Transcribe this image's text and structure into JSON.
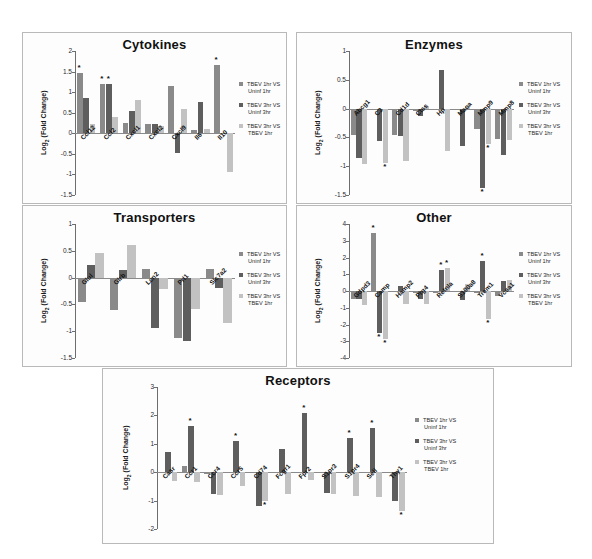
{
  "figure": {
    "series_colors": [
      "#8a8a8a",
      "#5e5e5e",
      "#c2c2c2"
    ],
    "legend": [
      {
        "label_line1": "TBEV 1hr VS",
        "label_line2": "Uninf 1hr"
      },
      {
        "label_line1": "TBEV 3hr VS",
        "label_line2": "Uninf 3hr"
      },
      {
        "label_line1": "TBEV 3hr VS",
        "label_line2": "TBEV 1hr"
      }
    ],
    "ylabel": "Log2 (Fold Change)",
    "significance_marker": "*"
  },
  "chart_data": [
    {
      "type": "bar",
      "title": "Cytokines",
      "xlabel": "",
      "ylabel": "Log2 (Fold Change)",
      "ylim": [
        -1.5,
        2
      ],
      "yticks": [
        2,
        1.5,
        1,
        0.5,
        0,
        -0.5,
        -1,
        -1.5
      ],
      "ytick_labels": [
        "2",
        "1.5",
        "1",
        "0.5",
        "0",
        "-0.5",
        "-1",
        "-1.5"
      ],
      "grid": false,
      "legend_position": "right",
      "categories": [
        "Ccl12",
        "Ccl2",
        "Cxcl1",
        "Cxcl2",
        "Cxcl9",
        "Il6",
        "Il10"
      ],
      "series": [
        {
          "name": "TBEV 1hr VS Uninf 1hr",
          "values": [
            1.47,
            1.19,
            0.24,
            0.23,
            1.15,
            0.07,
            1.66
          ]
        },
        {
          "name": "TBEV 3hr VS Uninf 3hr",
          "values": [
            0.85,
            1.21,
            0.55,
            0.23,
            -0.49,
            0.76,
            0.0
          ]
        },
        {
          "name": "TBEV 3hr VS TBEV 1hr",
          "values": [
            0.22,
            0.4,
            0.8,
            0.17,
            0.59,
            0.11,
            -0.93
          ]
        }
      ],
      "significance": [
        {
          "category": "Ccl12",
          "series": 0
        },
        {
          "category": "Ccl2",
          "series": 0
        },
        {
          "category": "Ccl2",
          "series": 1
        },
        {
          "category": "Il10",
          "series": 0
        }
      ]
    },
    {
      "type": "bar",
      "title": "Enzymes",
      "xlabel": "",
      "ylabel": "Log2 (Fold Change)",
      "ylim": [
        -1.5,
        1
      ],
      "yticks": [
        1,
        0.5,
        0,
        -0.5,
        -1,
        -1.5
      ],
      "ytick_labels": [
        "1",
        "0.5",
        "0",
        "-0.5",
        "-1",
        "-1.5"
      ],
      "grid": false,
      "legend_position": "right",
      "categories": [
        "Abcg1",
        "C3",
        "Cd1d",
        "Ctss",
        "Hp",
        "Maoa",
        "Mmp9",
        "Mmp8"
      ],
      "series": [
        {
          "name": "TBEV 1hr VS Uninf 1hr",
          "values": [
            -0.45,
            -0.02,
            -0.45,
            -0.05,
            -0.01,
            -0.02,
            -0.36,
            -0.52
          ]
        },
        {
          "name": "TBEV 3hr VS Uninf 3hr",
          "values": [
            -0.86,
            -0.57,
            -0.47,
            -0.12,
            0.67,
            -0.65,
            -1.38,
            -0.81
          ]
        },
        {
          "name": "TBEV 3hr VS TBEV 1hr",
          "values": [
            -0.96,
            -0.94,
            -0.91,
            0.04,
            -0.74,
            0.04,
            -0.62,
            -0.55
          ]
        }
      ],
      "significance": [
        {
          "category": "C3",
          "series": 2
        },
        {
          "category": "Mmp9",
          "series": 1
        },
        {
          "category": "Mmp9",
          "series": 2
        }
      ]
    },
    {
      "type": "bar",
      "title": "Transporters",
      "xlabel": "",
      "ylabel": "Log2 (Fold Change)",
      "ylim": [
        -1.5,
        1
      ],
      "yticks": [
        1,
        0.5,
        0,
        -0.5,
        -1,
        -1.5
      ],
      "ytick_labels": [
        "1",
        "0.5",
        "0",
        "-0.5",
        "-1",
        "-1.5"
      ],
      "grid": false,
      "legend_position": "right",
      "categories": [
        "Glul",
        "Glrb",
        "Lcn2",
        "Prl1",
        "Slc7a2"
      ],
      "series": [
        {
          "name": "TBEV 1hr VS Uninf 1hr",
          "values": [
            -0.45,
            -0.6,
            0.16,
            -1.12,
            0.16
          ]
        },
        {
          "name": "TBEV 3hr VS Uninf 3hr",
          "values": [
            0.23,
            0.14,
            -0.94,
            -1.18,
            -0.2
          ]
        },
        {
          "name": "TBEV 3hr VS TBEV 1hr",
          "values": [
            0.45,
            0.6,
            -0.22,
            -0.59,
            -0.85
          ]
        }
      ],
      "significance": []
    },
    {
      "type": "bar",
      "title": "Other",
      "xlabel": "",
      "ylabel": "Log2 (Fold Change)",
      "ylim": [
        -4,
        4
      ],
      "yticks": [
        4,
        3,
        2,
        1,
        0,
        -1,
        -2,
        -3,
        -4
      ],
      "ytick_labels": [
        "4",
        "3",
        "2",
        "1",
        "0",
        "-1",
        "-2",
        "-3",
        "-4"
      ],
      "grid": false,
      "legend_position": "right",
      "categories": [
        "Gdpd3",
        "Camp",
        "Hamp2",
        "Prg4",
        "Retnla",
        "S100a8",
        "Trem1",
        "Vcsa1"
      ],
      "series": [
        {
          "name": "TBEV 1hr VS Uninf 1hr",
          "values": [
            -0.48,
            3.45,
            -0.05,
            -0.09,
            -0.12,
            -0.07,
            -0.1,
            -0.3
          ]
        },
        {
          "name": "TBEV 3hr VS Uninf 3hr",
          "values": [
            -0.5,
            -2.48,
            0.3,
            -0.5,
            1.28,
            -0.55,
            1.82,
            0.62
          ]
        },
        {
          "name": "TBEV 3hr VS TBEV 1hr",
          "values": [
            -0.85,
            -2.88,
            -0.77,
            -0.8,
            1.38,
            0.42,
            -1.7,
            0.64
          ]
        }
      ],
      "significance": [
        {
          "category": "Camp",
          "series": 0
        },
        {
          "category": "Camp",
          "series": 1
        },
        {
          "category": "Camp",
          "series": 2
        },
        {
          "category": "Retnla",
          "series": 1
        },
        {
          "category": "Retnla",
          "series": 2
        },
        {
          "category": "Trem1",
          "series": 1
        },
        {
          "category": "Trem1",
          "series": 2
        }
      ]
    },
    {
      "type": "bar",
      "title": "Receptors",
      "xlabel": "",
      "ylabel": "Log2 (Fold Change)",
      "ylim": [
        -2,
        3
      ],
      "yticks": [
        3,
        2,
        1,
        0,
        -1,
        -2
      ],
      "ytick_labels": [
        "3",
        "2",
        "1",
        "0",
        "-1",
        "-2"
      ],
      "grid": false,
      "legend_position": "right",
      "categories": [
        "Casr",
        "Ccr1",
        "Ccr4",
        "Ccr5",
        "Cd74",
        "Fcgr1",
        "Fpr2",
        "S1pr3",
        "S1pr4",
        "Sell",
        "Thy1"
      ],
      "series": [
        {
          "name": "TBEV 1hr VS Uninf 1hr",
          "values": [
            -0.02,
            0.22,
            -0.05,
            -0.02,
            -0.02,
            -0.02,
            -0.03,
            -0.02,
            -0.02,
            -0.03,
            -0.02
          ]
        },
        {
          "name": "TBEV 3hr VS Uninf 3hr",
          "values": [
            0.7,
            1.64,
            -0.78,
            1.1,
            -1.18,
            0.82,
            2.1,
            -0.73,
            1.19,
            1.57,
            -1.0
          ]
        },
        {
          "name": "TBEV 3hr VS TBEV 1hr",
          "values": [
            -0.32,
            -0.36,
            -0.8,
            -0.47,
            -1.02,
            -0.77,
            -0.26,
            -0.77,
            -0.83,
            -0.87,
            -1.38
          ]
        }
      ],
      "significance": [
        {
          "category": "Ccr1",
          "series": 1
        },
        {
          "category": "Ccr5",
          "series": 1
        },
        {
          "category": "Cd74",
          "series": 2
        },
        {
          "category": "Fpr2",
          "series": 1
        },
        {
          "category": "S1pr4",
          "series": 1
        },
        {
          "category": "Sell",
          "series": 1
        },
        {
          "category": "Thy1",
          "series": 2
        }
      ]
    }
  ]
}
